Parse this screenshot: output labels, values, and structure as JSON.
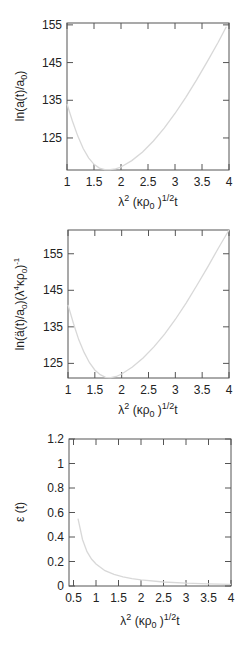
{
  "chart_data": [
    {
      "type": "line",
      "title": "",
      "xlabel": "λ² (κρ₀)^{1/2} t",
      "ylabel": "ln(a(t)/a₀)",
      "xlim": [
        1,
        4
      ],
      "ylim": [
        116.5,
        155.5
      ],
      "xticks": [
        1,
        1.5,
        2,
        2.5,
        3,
        3.5,
        4
      ],
      "xtick_labels": [
        "1",
        "1.5",
        "2",
        "2.5",
        "3",
        "3.5",
        "4"
      ],
      "yticks": [
        125,
        135,
        145,
        155
      ],
      "ytick_labels": [
        "125",
        "135",
        "145",
        "155"
      ],
      "grid": false,
      "legend": null,
      "series": [
        {
          "name": "ln(a(t)/a0)",
          "x": [
            1.0,
            1.1,
            1.2,
            1.3,
            1.4,
            1.5,
            1.6,
            1.7,
            1.8,
            1.9,
            2.0,
            2.2,
            2.4,
            2.6,
            2.8,
            3.0,
            3.2,
            3.4,
            3.6,
            3.8,
            3.95
          ],
          "y": [
            134,
            129.5,
            125.5,
            122.2,
            119.7,
            118.0,
            117.0,
            116.6,
            116.6,
            116.8,
            117.3,
            119.0,
            121.3,
            124.2,
            127.6,
            131.5,
            135.8,
            140.4,
            145.3,
            150.4,
            154.5
          ]
        }
      ]
    },
    {
      "type": "line",
      "title": "",
      "xlabel": "λ² (κρ₀)^{1/2} t",
      "ylabel": "ln(ä(t)/a₀)(λ⁴κρ₀)⁻¹",
      "xlim": [
        1,
        4
      ],
      "ylim": [
        121,
        161.5
      ],
      "xticks": [
        1,
        1.5,
        2,
        2.5,
        3,
        3.5,
        4
      ],
      "xtick_labels": [
        "1",
        "1.5",
        "2",
        "2.5",
        "3",
        "3.5",
        "4"
      ],
      "yticks": [
        125,
        135,
        145,
        155
      ],
      "ytick_labels": [
        "125",
        "135",
        "145",
        "155"
      ],
      "grid": false,
      "legend": null,
      "series": [
        {
          "name": "ln(a''(t)/a0)(lambda^4 kappa rho0)^-1",
          "x": [
            1.0,
            1.1,
            1.2,
            1.3,
            1.4,
            1.5,
            1.6,
            1.7,
            1.8,
            1.9,
            2.0,
            2.2,
            2.4,
            2.6,
            2.8,
            3.0,
            3.2,
            3.4,
            3.6,
            3.8,
            4.0
          ],
          "y": [
            141,
            136,
            131.5,
            128,
            125.2,
            123.2,
            121.9,
            121.2,
            121.1,
            121.4,
            122.1,
            124.0,
            126.5,
            129.5,
            133.0,
            137.0,
            141.5,
            146.3,
            151.3,
            156.5,
            161.5
          ]
        }
      ]
    },
    {
      "type": "line",
      "title": "",
      "xlabel": "λ² (κρ₀)^{1/2} t",
      "ylabel": "ε (t)",
      "xlim": [
        0.4,
        4
      ],
      "ylim": [
        0,
        1.2
      ],
      "xticks": [
        0.5,
        1,
        1.5,
        2,
        2.5,
        3,
        3.5,
        4
      ],
      "xtick_labels": [
        "0.5",
        "1",
        "1.5",
        "2",
        "2.5",
        "3",
        "3.5",
        "4"
      ],
      "yticks": [
        0,
        0.2,
        0.4,
        0.6,
        0.8,
        1,
        1.2
      ],
      "ytick_labels": [
        "0",
        "0.2",
        "0.4",
        "0.6",
        "0.8",
        "1",
        "1.2"
      ],
      "grid": false,
      "legend": null,
      "series": [
        {
          "name": "epsilon(t)",
          "x": [
            0.6,
            0.7,
            0.8,
            0.9,
            1.0,
            1.2,
            1.4,
            1.6,
            1.8,
            2.0,
            2.5,
            3.0,
            3.5,
            4.0
          ],
          "y": [
            0.55,
            0.38,
            0.28,
            0.22,
            0.18,
            0.125,
            0.095,
            0.075,
            0.06,
            0.05,
            0.033,
            0.023,
            0.017,
            0.013
          ]
        }
      ]
    }
  ],
  "panels": [
    {
      "ylabel_main": "ln(a(t)/a",
      "ylabel_sub": "0",
      "ylabel_end": ")"
    },
    {
      "ylabel_main": "ln(ä(t)/a",
      "ylabel_sub": "0",
      "ylabel_mid": ")(λ",
      "ylabel_sup": "4",
      "ylabel_mid2": "κρ",
      "ylabel_sub2": "0",
      "ylabel_end": ")",
      "ylabel_sup2": "-1"
    },
    {
      "ylabel_main": "ε (t)"
    }
  ],
  "xlabel_parts": {
    "lambda": "λ",
    "sup2": "2",
    "open": " (κρ",
    "sub0": "0",
    "close": " )",
    "sup_half": "1/2",
    "t": "t"
  },
  "style": {
    "curve_color": "#d8d8d8",
    "axis_color": "#555555",
    "text_color": "#222222"
  }
}
